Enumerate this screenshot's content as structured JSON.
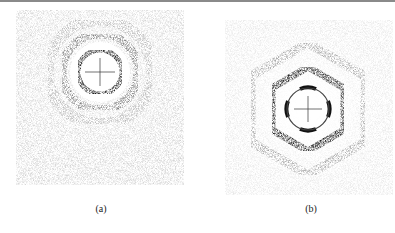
{
  "figure": {
    "panels": [
      {
        "id": "a",
        "caption": "(a)",
        "pattern": "ring diffraction pattern (isotropic)",
        "center": [
          100,
          72
        ]
      },
      {
        "id": "b",
        "caption": "(b)",
        "pattern": "hexagonal diffraction pattern (six-fold)",
        "center": [
          308,
          109
        ]
      }
    ]
  },
  "colors": {
    "ink": "#1a1a1a",
    "background": "#ffffff",
    "rule": "#8a8a8a"
  }
}
